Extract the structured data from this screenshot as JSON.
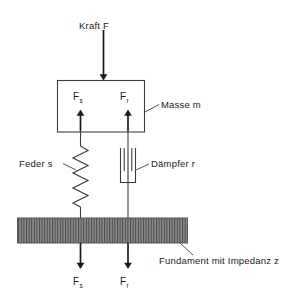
{
  "diagram": {
    "title_label": "Kraft F",
    "mass_label": "Masse m",
    "spring_label": "Feder s",
    "damper_label": "Dämpfer r",
    "foundation_label": "Fundament mit Impedanz z",
    "force_spring": {
      "symbol": "F",
      "subscript": "s"
    },
    "force_damper": {
      "symbol": "F",
      "subscript": "r"
    },
    "force_spring_bottom": {
      "symbol": "F",
      "subscript": "s"
    },
    "force_damper_bottom": {
      "symbol": "F",
      "subscript": "r"
    }
  },
  "colors": {
    "line": "#3d3d3d",
    "arrow": "#1a1a1a",
    "text": "#1a1a1a",
    "foundation_fill": "#8c8c8c",
    "foundation_hatch": "#4a4a4a",
    "foundation_border": "#555555",
    "background": "#ffffff"
  }
}
